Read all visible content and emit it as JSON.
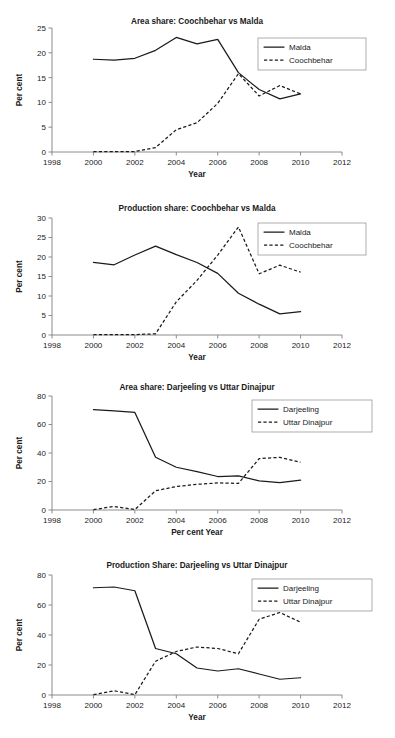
{
  "figure": {
    "panel_count": 4,
    "background_color": "#ffffff",
    "line_color": "#1a1a1a",
    "axis_color": "#808080"
  },
  "chart_data": [
    {
      "id": "chart-area-coochbehar-malda",
      "type": "line",
      "title": "Area share: Coochbehar vs Malda",
      "xlabel": "Year",
      "ylabel": "Per cent",
      "xlim": [
        1998,
        2012
      ],
      "ylim": [
        0,
        25
      ],
      "xticks": [
        1998,
        2000,
        2002,
        2004,
        2006,
        2008,
        2010,
        2012
      ],
      "yticks": [
        0,
        5,
        10,
        15,
        20,
        25
      ],
      "grid": false,
      "legend_position": "top-right",
      "x": [
        2000,
        2001,
        2002,
        2003,
        2004,
        2005,
        2006,
        2007,
        2008,
        2009,
        2010
      ],
      "series": [
        {
          "name": "Malda",
          "style": "solid",
          "values": [
            18.7,
            18.5,
            18.9,
            20.5,
            23.1,
            21.8,
            22.7,
            16.0,
            12.6,
            10.7,
            11.7
          ]
        },
        {
          "name": "Coochbehar",
          "style": "dashed",
          "values": [
            0.1,
            0.1,
            0.1,
            0.9,
            4.5,
            5.9,
            9.8,
            15.8,
            11.3,
            13.4,
            11.7
          ]
        }
      ]
    },
    {
      "id": "chart-production-coochbehar-malda",
      "type": "line",
      "title": "Production share: Coochbehar vs Malda",
      "xlabel": "Year",
      "ylabel": "Per cent",
      "xlim": [
        1998,
        2012
      ],
      "ylim": [
        0,
        30
      ],
      "xticks": [
        1998,
        2000,
        2002,
        2004,
        2006,
        2008,
        2010,
        2012
      ],
      "yticks": [
        0,
        5,
        10,
        15,
        20,
        25,
        30
      ],
      "grid": false,
      "legend_position": "top-right",
      "x": [
        2000,
        2001,
        2002,
        2003,
        2004,
        2005,
        2006,
        2007,
        2008,
        2009,
        2010
      ],
      "series": [
        {
          "name": "Malda",
          "style": "solid",
          "values": [
            18.6,
            18.0,
            20.5,
            22.8,
            20.6,
            18.6,
            15.8,
            10.7,
            7.9,
            5.4,
            6.0
          ]
        },
        {
          "name": "Coochbehar",
          "style": "dashed",
          "values": [
            0.1,
            0.1,
            0.1,
            0.3,
            8.5,
            14.0,
            20.5,
            27.7,
            15.7,
            17.9,
            16.1
          ]
        }
      ]
    },
    {
      "id": "chart-area-darjeeling-uttar-dinajpur",
      "type": "line",
      "title": "Area share: Darjeeling vs Uttar Dinajpur",
      "xlabel": "Per cent Year",
      "ylabel": "Per cent",
      "xlim": [
        1998,
        2012
      ],
      "ylim": [
        0,
        80
      ],
      "xticks": [
        1998,
        2000,
        2002,
        2004,
        2006,
        2008,
        2010,
        2012
      ],
      "yticks": [
        0,
        20,
        40,
        60,
        80
      ],
      "grid": false,
      "legend_position": "top-right",
      "x": [
        2000,
        2001,
        2002,
        2003,
        2004,
        2005,
        2006,
        2007,
        2008,
        2009,
        2010
      ],
      "series": [
        {
          "name": "Darjeeling",
          "style": "solid",
          "values": [
            70.5,
            69.5,
            68.5,
            37.0,
            30.0,
            27.0,
            23.5,
            24.0,
            20.5,
            19.2,
            21.0
          ]
        },
        {
          "name": "Uttar Dinajpur",
          "style": "dashed",
          "values": [
            0.3,
            2.5,
            0.3,
            13.5,
            16.5,
            18.0,
            19.0,
            18.7,
            36.0,
            37.0,
            33.5
          ]
        }
      ]
    },
    {
      "id": "chart-production-darjeeling-uttar-dinajpur",
      "type": "line",
      "title": "Production Share: Darjeeling vs Uttar Dinajpur",
      "xlabel": "Year",
      "ylabel": "Per cent",
      "xlim": [
        1998,
        2012
      ],
      "ylim": [
        0,
        80
      ],
      "xticks": [
        1998,
        2000,
        2002,
        2004,
        2006,
        2008,
        2010,
        2012
      ],
      "yticks": [
        0,
        20,
        40,
        60,
        80
      ],
      "grid": false,
      "legend_position": "top-right",
      "x": [
        2000,
        2001,
        2002,
        2003,
        2004,
        2005,
        2006,
        2007,
        2008,
        2009,
        2010
      ],
      "series": [
        {
          "name": "Darjeeling",
          "style": "solid",
          "values": [
            71.5,
            72.0,
            69.5,
            31.0,
            27.5,
            18.0,
            16.0,
            17.5,
            14.0,
            10.5,
            11.5
          ]
        },
        {
          "name": "Uttar Dinajpur",
          "style": "dashed",
          "values": [
            0.2,
            2.8,
            0.2,
            22.5,
            29.0,
            32.0,
            31.0,
            27.5,
            50.5,
            55.0,
            48.5
          ]
        }
      ]
    }
  ]
}
